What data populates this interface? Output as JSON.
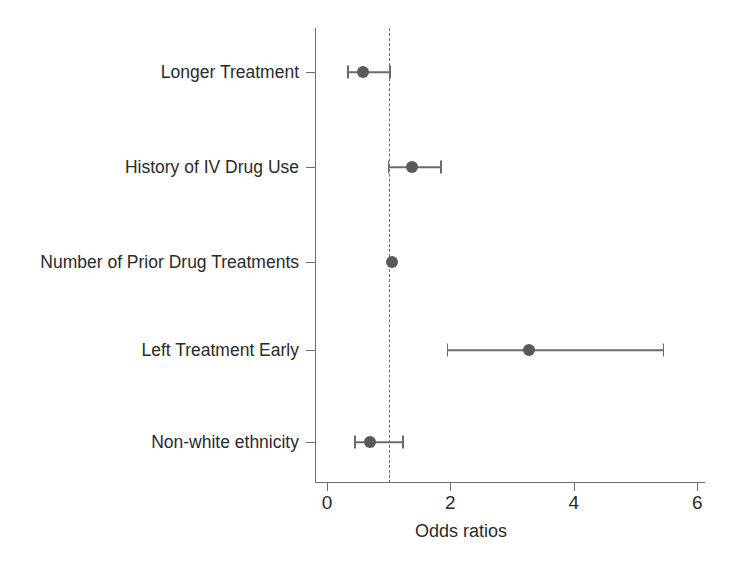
{
  "chart_data": {
    "type": "scatter",
    "chart_subtype": "forest-plot",
    "title": "",
    "xlabel": "Odds ratios",
    "ylabel": "",
    "xlim": [
      0,
      6.26
    ],
    "xticks": [
      0,
      2,
      4,
      6
    ],
    "xtick_labels": [
      "0",
      "2",
      "4",
      "6"
    ],
    "grid": false,
    "legend": null,
    "reference_line": {
      "value": 1,
      "style": "dashed",
      "color": "#6e6e6e"
    },
    "categories": [
      "Longer Treatment",
      "History of IV Drug Use",
      "Number of Prior Drug Treatments",
      "Left Treatment Early",
      "Non-white ethnicity"
    ],
    "values": [
      0.58,
      1.37,
      1.05,
      3.27,
      0.69
    ],
    "ci_low": [
      0.34,
      1.0,
      0.98,
      1.95,
      0.45
    ],
    "ci_high": [
      1.02,
      1.85,
      1.14,
      5.45,
      1.23
    ],
    "series": [
      {
        "name": "Odds ratio",
        "points": [
          {
            "label": "Longer Treatment",
            "or": 0.58,
            "low": 0.34,
            "high": 1.02
          },
          {
            "label": "History of IV Drug Use",
            "or": 1.37,
            "low": 1.0,
            "high": 1.85
          },
          {
            "label": "Number of Prior Drug Treatments",
            "or": 1.05,
            "low": 0.98,
            "high": 1.14
          },
          {
            "label": "Left Treatment Early",
            "or": 3.27,
            "low": 1.95,
            "high": 5.45
          },
          {
            "label": "Non-white ethnicity",
            "or": 0.69,
            "low": 0.45,
            "high": 1.23
          }
        ]
      }
    ],
    "marker_color": "#5a5a5a",
    "line_color": "#6b6b6b",
    "axis_color": "#6e6e6e"
  },
  "axis": {
    "x_title": "Odds ratios",
    "ticks": [
      {
        "label": "0",
        "value": 0
      },
      {
        "label": "2",
        "value": 2
      },
      {
        "label": "4",
        "value": 4
      },
      {
        "label": "6",
        "value": 6
      }
    ]
  },
  "rows": [
    {
      "label": "Longer Treatment"
    },
    {
      "label": "History of IV Drug Use"
    },
    {
      "label": "Number of Prior Drug Treatments"
    },
    {
      "label": "Left Treatment Early"
    },
    {
      "label": "Non-white ethnicity"
    }
  ]
}
